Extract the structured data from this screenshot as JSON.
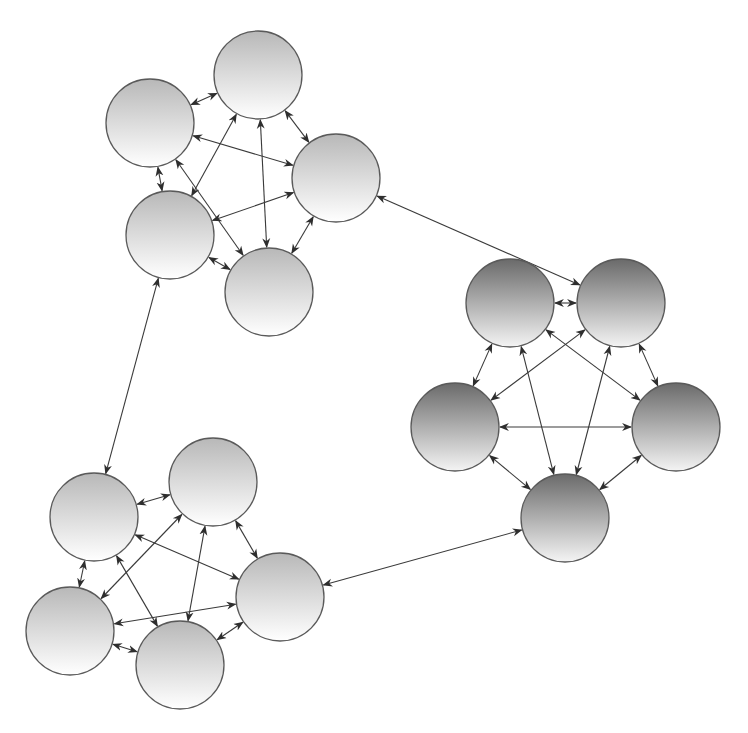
{
  "diagram": {
    "title": "",
    "node_radius": 44,
    "colors": {
      "edge": "#3a3a3a",
      "node_stroke": "#5a5a5a",
      "light_top": "#b8b8b8",
      "light_bottom": "#ffffff",
      "dark_top": "#6a6a6a",
      "dark_bottom": "#f4f4f4"
    },
    "clusters": [
      {
        "id": "cluster-top",
        "style": "light",
        "nodes": [
          {
            "id": "A",
            "x": 258,
            "y": 75
          },
          {
            "id": "B",
            "x": 150,
            "y": 123
          },
          {
            "id": "C",
            "x": 336,
            "y": 178
          },
          {
            "id": "D",
            "x": 170,
            "y": 235
          },
          {
            "id": "E",
            "x": 269,
            "y": 292
          }
        ]
      },
      {
        "id": "cluster-right",
        "style": "dark",
        "nodes": [
          {
            "id": "F",
            "x": 510,
            "y": 303
          },
          {
            "id": "G",
            "x": 621,
            "y": 303
          },
          {
            "id": "H",
            "x": 455,
            "y": 427
          },
          {
            "id": "I",
            "x": 676,
            "y": 427
          },
          {
            "id": "J",
            "x": 565,
            "y": 518
          }
        ]
      },
      {
        "id": "cluster-bottom",
        "style": "light",
        "nodes": [
          {
            "id": "K",
            "x": 94,
            "y": 517
          },
          {
            "id": "L",
            "x": 213,
            "y": 482
          },
          {
            "id": "M",
            "x": 280,
            "y": 597
          },
          {
            "id": "N",
            "x": 70,
            "y": 631
          },
          {
            "id": "O",
            "x": 180,
            "y": 665
          }
        ]
      }
    ],
    "intra_cluster_edges": "complete-graph, bidirectional",
    "inter_cluster_edges": [
      {
        "from": "C",
        "to": "G",
        "bidirectional": true
      },
      {
        "from": "D",
        "to": "K",
        "bidirectional": true
      },
      {
        "from": "M",
        "to": "J",
        "bidirectional": true
      }
    ]
  }
}
